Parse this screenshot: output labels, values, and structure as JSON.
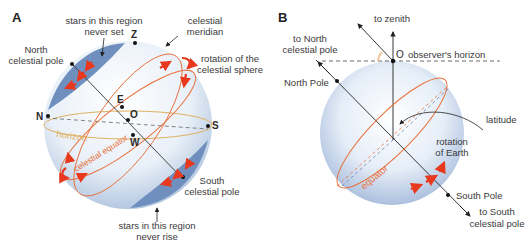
{
  "panel_a": {
    "letter": "A",
    "labels": {
      "never_set_1": "stars in this region",
      "never_set_2": "never set",
      "zenith": "Z",
      "meridian_1": "celestial",
      "meridian_2": "meridian",
      "ncp_1": "North",
      "ncp_2": "celestial pole",
      "rotation_1": "rotation of the",
      "rotation_2": "celestial sphere",
      "east": "E",
      "north": "N",
      "origin": "O",
      "south": "S",
      "west": "W",
      "horizon": "horizon",
      "celestial_equator": "celestial equator",
      "scp_1": "South",
      "scp_2": "celestial pole",
      "never_rise_1": "stars in this region",
      "never_rise_2": "never rise"
    }
  },
  "panel_b": {
    "letter": "B",
    "labels": {
      "to_zenith": "to zenith",
      "to_ncp_1": "to North",
      "to_ncp_2": "celestial pole",
      "origin": "O",
      "observer_horizon": "observer's horizon",
      "north_pole": "North Pole",
      "latitude": "latitude",
      "rotation_1": "rotation",
      "rotation_2": "of Earth",
      "equator": "equator",
      "south_pole": "South Pole",
      "to_scp_1": "to South",
      "to_scp_2": "celestial pole"
    }
  },
  "colors": {
    "sphere_edge": "#a9bfdc",
    "polar_cap": "#6f8fbf",
    "arrow_red": "#e8391f",
    "equator_orange": "#e8703a",
    "horizon_tan": "#e0b060",
    "axis_dark": "#333333"
  }
}
